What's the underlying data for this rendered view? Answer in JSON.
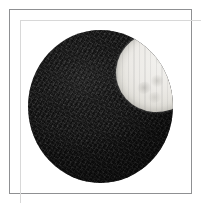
{
  "image": {
    "caption": "",
    "subject_label": "dark textured sphere",
    "background_color": "#ffffff",
    "frame": {
      "label": "image frame",
      "border_color": "#8f9092",
      "border_width_px": 1,
      "inset_px": 9,
      "width_px": 183,
      "height_px": 185
    },
    "canvas": {
      "width_px": 202,
      "height_px": 204
    },
    "sphere": {
      "label": "sphere",
      "fill_color": "#181818",
      "highlight_color": "#242424",
      "center_x_px": 100,
      "center_y_px": 106,
      "radius_x_px": 72,
      "radius_y_px": 76,
      "texture": "grainy"
    },
    "patch": {
      "label": "pale elliptical patch",
      "fill_color": "#eceae6",
      "edge_color": "#d6d3cc",
      "center_x_px": 129,
      "center_y_px": 72,
      "radius_x_px": 41,
      "radius_y_px": 40,
      "rotation_deg": -18,
      "spot_count": 4,
      "spot_color": "#aaa8a2"
    }
  }
}
